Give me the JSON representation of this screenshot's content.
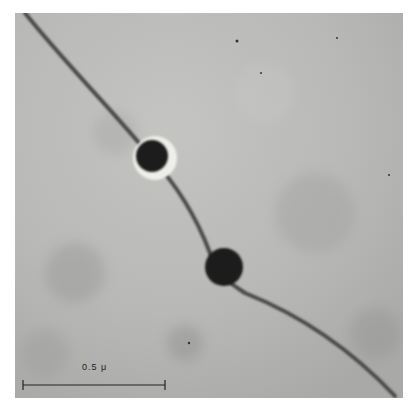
{
  "figure": {
    "type": "electron-micrograph",
    "scale_bar": {
      "label": "0.5 μ"
    },
    "colors": {
      "background": "#b9b9b7",
      "filament": "#4a4a4a",
      "particle": "#1e1e1e",
      "halo": "#eeeeea"
    }
  }
}
